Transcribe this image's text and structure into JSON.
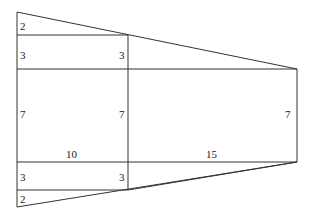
{
  "diagram": {
    "labels": {
      "top_triangle_left": "2",
      "upper_rect_left": "3",
      "upper_rect_right": "3",
      "middle_rect_left": "7",
      "middle_rect_right": "7",
      "right_rect_right": "7",
      "width_left": "10",
      "width_right": "15",
      "lower_rect_left": "3",
      "lower_rect_right": "3",
      "bottom_triangle_left": "2"
    },
    "colors": {
      "stroke": "#333333",
      "text": "#222222",
      "background": "#ffffff"
    }
  }
}
